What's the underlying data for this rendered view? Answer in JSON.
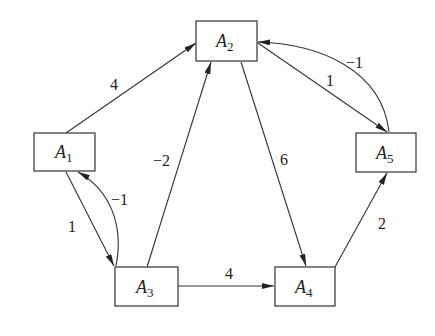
{
  "diagram": {
    "type": "weighted directed graph",
    "nodes": [
      {
        "id": "A1",
        "base": "A",
        "sub": "1",
        "x": 34,
        "y": 133,
        "w": 61,
        "h": 38
      },
      {
        "id": "A2",
        "base": "A",
        "sub": "2",
        "x": 196,
        "y": 21,
        "w": 61,
        "h": 40
      },
      {
        "id": "A3",
        "base": "A",
        "sub": "3",
        "x": 115,
        "y": 267,
        "w": 63,
        "h": 39
      },
      {
        "id": "A4",
        "base": "A",
        "sub": "4",
        "x": 275,
        "y": 267,
        "w": 60,
        "h": 39
      },
      {
        "id": "A5",
        "base": "A",
        "sub": "5",
        "x": 356,
        "y": 133,
        "w": 60,
        "h": 39
      }
    ],
    "edges": [
      {
        "from": "A1",
        "to": "A2",
        "weight": "4"
      },
      {
        "from": "A1",
        "to": "A3",
        "weight": "1"
      },
      {
        "from": "A3",
        "to": "A1",
        "weight": "−1"
      },
      {
        "from": "A3",
        "to": "A2",
        "weight": "−2"
      },
      {
        "from": "A2",
        "to": "A4",
        "weight": "6"
      },
      {
        "from": "A2",
        "to": "A5",
        "weight": "1"
      },
      {
        "from": "A5",
        "to": "A2",
        "weight": "−1"
      },
      {
        "from": "A3",
        "to": "A4",
        "weight": "4"
      },
      {
        "from": "A4",
        "to": "A5",
        "weight": "2"
      }
    ]
  }
}
